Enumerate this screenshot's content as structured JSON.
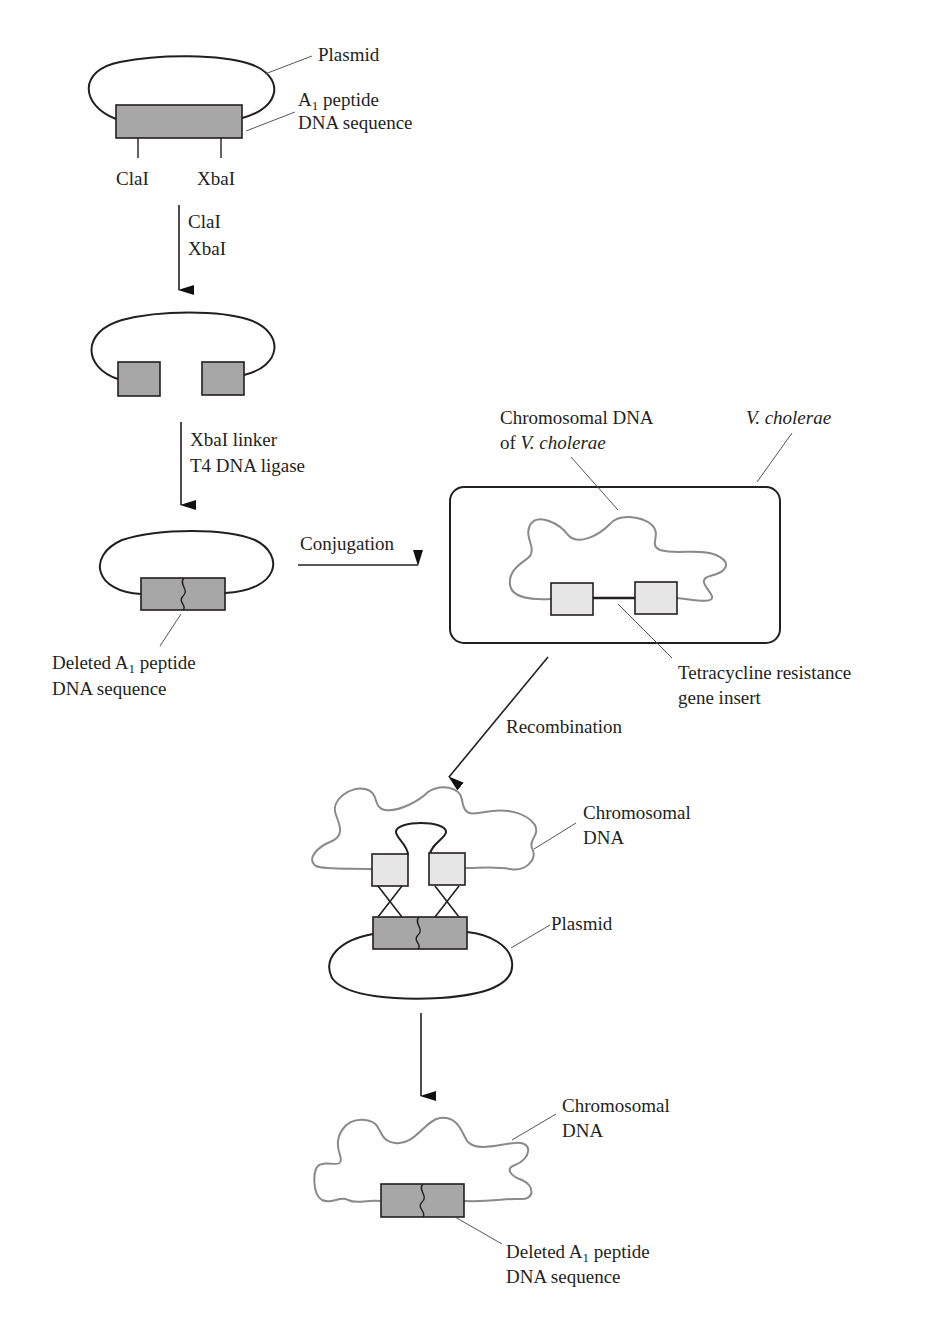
{
  "figure": {
    "type": "gene-deletion-process-diagram",
    "colors": {
      "stroke": "#231f20",
      "a1_box_fill": "#a7a7a7",
      "tet_box_fill": "#e6e6e6",
      "chromosome_stroke": "#8a8a8a",
      "leader_line": "#555555"
    }
  },
  "step1_plasmid": {
    "plasmid_label": "Plasmid",
    "a1_label_prefix": "A",
    "a1_label_sub": "1",
    "a1_label_suffix": " peptide",
    "a1_label_line2": "DNA sequence",
    "site_left": "ClaI",
    "site_right": "XbaI"
  },
  "arrow1": {
    "line1": "ClaI",
    "line2": "XbaI"
  },
  "arrow2": {
    "line1": "XbaI linker",
    "line2": "T4 DNA ligase"
  },
  "step3_plasmid": {
    "deleted_label_prefix": "Deleted A",
    "deleted_label_sub": "1",
    "deleted_label_suffix": " peptide",
    "deleted_label_line2": "DNA sequence"
  },
  "conjugation_arrow": {
    "label": "Conjugation"
  },
  "vcholerae_cell": {
    "cell_label": "V. cholerae",
    "chromosome_label_line1": "Chromosomal DNA",
    "chromosome_label_line2_prefix": "of ",
    "chromosome_label_line2_italic": "V. cholerae",
    "tet_label_line1": "Tetracycline resistance",
    "tet_label_line2": "gene insert"
  },
  "recombination_arrow": {
    "label": "Recombination"
  },
  "recombination_step": {
    "chromosome_label_line1": "Chromosomal",
    "chromosome_label_line2": "DNA",
    "plasmid_label": "Plasmid"
  },
  "final_step": {
    "chromosome_label_line1": "Chromosomal",
    "chromosome_label_line2": "DNA",
    "deleted_label_prefix": "Deleted A",
    "deleted_label_sub": "1",
    "deleted_label_suffix": " peptide",
    "deleted_label_line2": "DNA sequence"
  }
}
